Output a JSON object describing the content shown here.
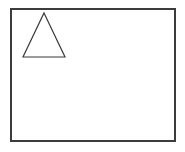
{
  "canvas": {
    "width": 185,
    "height": 152,
    "background_color": "#ffffff"
  },
  "figure": {
    "title": "",
    "shape_count": 2
  },
  "chart_data": {
    "type": "diagram",
    "title": "",
    "xlabel": "",
    "ylabel": "",
    "shapes": [
      {
        "name": "frame-rectangle",
        "kind": "rectangle",
        "x": 11,
        "y": 9,
        "width": 164,
        "height": 132,
        "fill": "none",
        "stroke": "#3c3c3c",
        "stroke_width": 1.3
      },
      {
        "name": "triangle",
        "kind": "triangle",
        "points": "44,13 65,57 23,57",
        "apex": [
          44,
          13
        ],
        "base_left": [
          23,
          57
        ],
        "base_right": [
          65,
          57
        ],
        "base_width": 42,
        "height": 44,
        "fill": "none",
        "stroke": "#3a3a3a",
        "stroke_width": 1.2
      }
    ]
  }
}
